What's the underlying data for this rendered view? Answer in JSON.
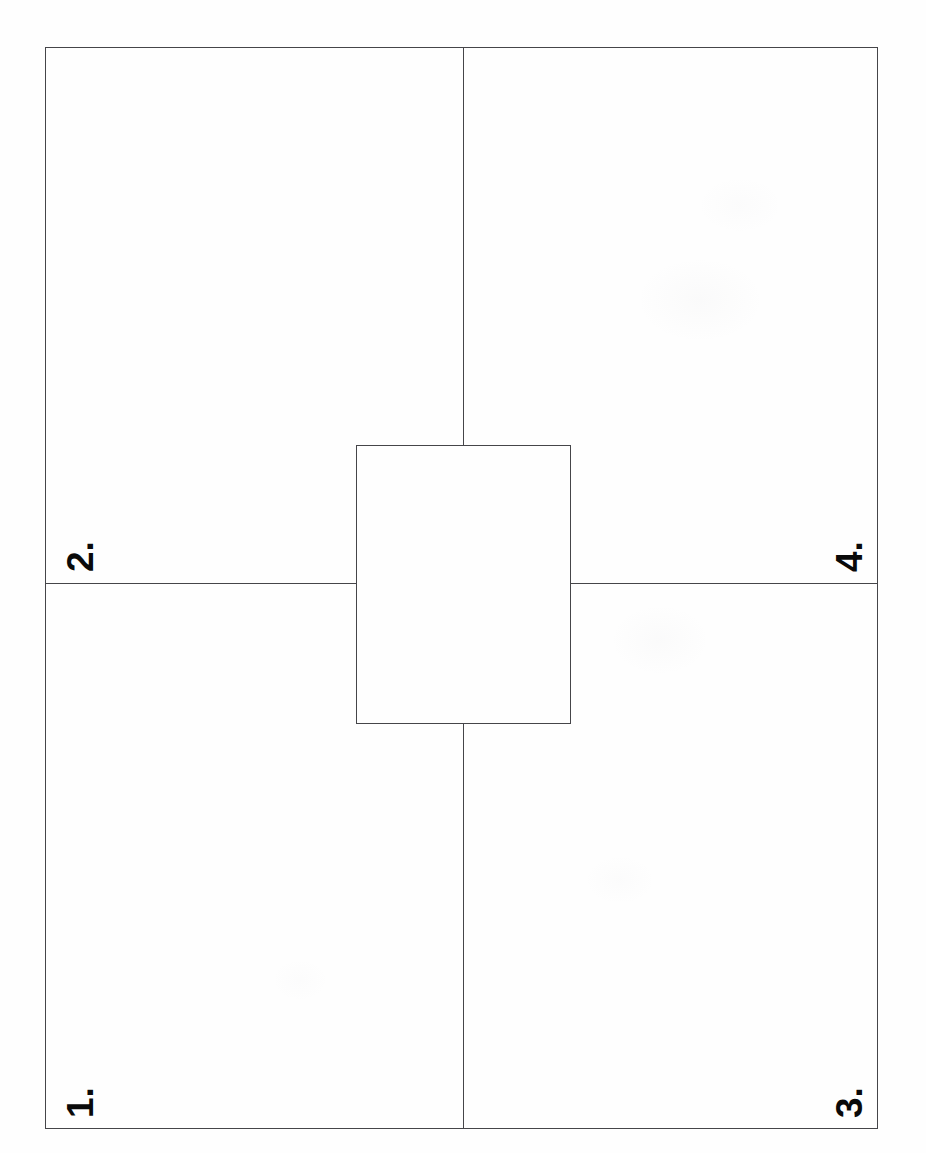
{
  "page": {
    "kind": "scanned-diagram",
    "orientation": "rotated-90-ccw",
    "width": 926,
    "height": 1153,
    "background_color": "#fefefe",
    "line_color": "#454549",
    "label_color": "#0a0a0a"
  },
  "diagram": {
    "title": "",
    "frame": {
      "name": "sheet-outline",
      "x": 45,
      "y": 47,
      "width": 833,
      "height": 1082
    },
    "dividers": [
      {
        "name": "vertical-divider",
        "orientation": "vertical",
        "position": 463
      },
      {
        "name": "horizontal-divider",
        "orientation": "horizontal",
        "position": 583
      }
    ],
    "centre_rectangle": {
      "name": "centre-rectangle",
      "x": 356,
      "y": 445,
      "width": 215,
      "height": 279
    },
    "labels": [
      {
        "id": "1",
        "text": "1.",
        "quadrant": "lower-left",
        "rotation_deg": -90
      },
      {
        "id": "2",
        "text": "2.",
        "quadrant": "upper-left",
        "rotation_deg": -90
      },
      {
        "id": "3",
        "text": "3.",
        "quadrant": "lower-right",
        "rotation_deg": -90
      },
      {
        "id": "4",
        "text": "4.",
        "quadrant": "upper-right",
        "rotation_deg": -90
      }
    ]
  }
}
